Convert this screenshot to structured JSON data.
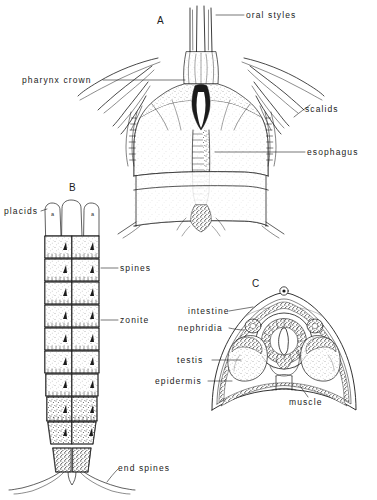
{
  "plate": {
    "background_color": "#ffffff",
    "ink_color": "#1b1b1b",
    "figures": [
      {
        "letter": "A",
        "name": "pharynx-and-head-region",
        "labels": [
          {
            "key": "oral_styles",
            "text": "oral styles"
          },
          {
            "key": "pharynx_crown",
            "text": "pharynx crown"
          },
          {
            "key": "scalids",
            "text": "scalids"
          },
          {
            "key": "esophagus",
            "text": "esophagus"
          }
        ]
      },
      {
        "letter": "B",
        "name": "dorsal-view-segmented-body",
        "labels": [
          {
            "key": "placids",
            "text": "placids"
          },
          {
            "key": "placid_mark_left",
            "text": "a"
          },
          {
            "key": "placid_mark_right",
            "text": "a"
          },
          {
            "key": "spines",
            "text": "spines"
          },
          {
            "key": "zonite",
            "text": "zonite"
          },
          {
            "key": "end_spines",
            "text": "end spines"
          }
        ],
        "zonite_count": 9
      },
      {
        "letter": "C",
        "name": "transverse-cross-section",
        "labels": [
          {
            "key": "intestine",
            "text": "intestine"
          },
          {
            "key": "nephridia",
            "text": "nephridia"
          },
          {
            "key": "testis",
            "text": "testis"
          },
          {
            "key": "epidermis",
            "text": "epidermis"
          },
          {
            "key": "muscle",
            "text": "muscle"
          }
        ]
      }
    ],
    "figure_a": {
      "letter": "A",
      "oral_styles": "oral styles",
      "pharynx_crown": "pharynx crown",
      "scalids": "scalids",
      "esophagus": "esophagus"
    },
    "figure_b": {
      "letter": "B",
      "placids": "placids",
      "placid_a_left": "a",
      "placid_a_right": "a",
      "spines": "spines",
      "zonite": "zonite",
      "end_spines": "end spines"
    },
    "figure_c": {
      "letter": "C",
      "intestine": "intestine",
      "nephridia": "nephridia",
      "testis": "testis",
      "epidermis": "epidermis",
      "muscle": "muscle"
    }
  }
}
